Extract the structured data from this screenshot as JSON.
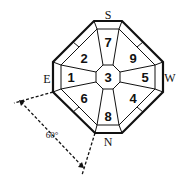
{
  "diagram": {
    "directions": {
      "top": "S",
      "right": "W",
      "bottom": "N",
      "left": "E"
    },
    "sectors": {
      "top": "7",
      "top_left": "2",
      "top_right": "9",
      "left": "1",
      "center": "3",
      "right": "5",
      "bottom_left": "6",
      "bottom_right": "4",
      "bottom": "8"
    },
    "angle_label": "60°",
    "colors": {
      "line": "#111111",
      "background": "#ffffff"
    }
  }
}
